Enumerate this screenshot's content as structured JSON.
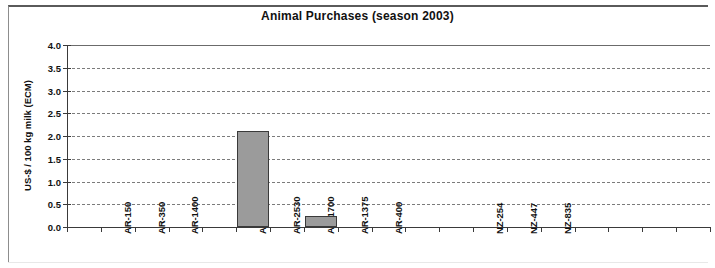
{
  "chart_data": {
    "type": "bar",
    "title": "Animal Purchases (season 2003)",
    "xlabel": "",
    "ylabel": "US-$ / 100 kg milk (ECM)",
    "ylim": [
      0.0,
      4.0
    ],
    "ytick_labels": [
      "0.0",
      "0.5",
      "1.0",
      "1.5",
      "2.0",
      "2.5",
      "3.0",
      "3.5",
      "4.0"
    ],
    "ytick_values": [
      0.0,
      0.5,
      1.0,
      1.5,
      2.0,
      2.5,
      3.0,
      3.5,
      4.0
    ],
    "grid": "horizontal-dashed",
    "legend": "none",
    "categories": [
      "",
      "AR-150",
      "AR-350",
      "AR-1400",
      "",
      "AR-6350",
      "AR-2530",
      "AR-1700",
      "AR-1375",
      "AR-400",
      "",
      "",
      "NZ-254",
      "NZ-447",
      "NZ-835",
      "",
      "",
      "",
      ""
    ],
    "values": [
      0.0,
      0.0,
      0.0,
      0.0,
      0.0,
      2.1,
      0.0,
      0.24,
      0.0,
      0.0,
      0.0,
      0.0,
      0.0,
      0.0,
      0.0,
      0.0,
      0.0,
      0.0,
      0.0
    ]
  }
}
